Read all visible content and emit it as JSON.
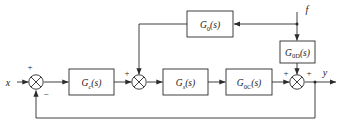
{
  "diagram": {
    "background_color": "#ffffff",
    "line_color": "#2b2b2b",
    "signals": {
      "input": "x",
      "disturbance": "f",
      "output": "y"
    },
    "blocks": [
      {
        "id": "gc",
        "base": "G",
        "sub": "c",
        "arg": "(s)",
        "full": "Gc(s)"
      },
      {
        "id": "gs",
        "base": "G",
        "sub": "s",
        "arg": "(s)",
        "full": "Gs(s)"
      },
      {
        "id": "g0c",
        "base": "G",
        "sub": "0C",
        "arg": "(s)",
        "full": "G0C(s)"
      },
      {
        "id": "g0",
        "base": "G",
        "sub": "0",
        "arg": "(s)",
        "full": "G0(s)"
      },
      {
        "id": "g0d",
        "base": "G",
        "sub": "0D",
        "arg": "(s)",
        "full": "G0D(s)"
      }
    ],
    "summing_junctions": [
      {
        "id": "sum1",
        "signs": [
          {
            "label": "+",
            "position": "top-left"
          },
          {
            "label": "−",
            "position": "bottom-right"
          }
        ]
      },
      {
        "id": "sum2",
        "signs": [
          {
            "label": "+",
            "position": "left"
          }
        ]
      },
      {
        "id": "sum3",
        "signs": [
          {
            "label": "+",
            "position": "top-left"
          },
          {
            "label": "+",
            "position": "top-right"
          }
        ]
      }
    ]
  }
}
